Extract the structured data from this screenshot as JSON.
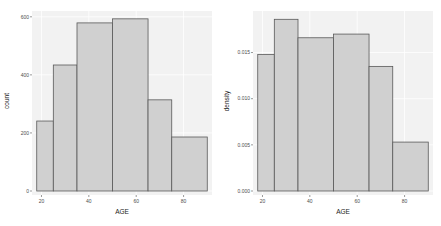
{
  "colors": {
    "panel_bg": "#f2f2f2",
    "grid": "#ffffff",
    "bar_fill": "#d0d0d0",
    "bar_stroke": "#595959",
    "tick_text": "#4d4d4d"
  },
  "chart_data": [
    {
      "type": "bar",
      "subtype": "histogram",
      "title": "",
      "xlabel": "AGE",
      "ylabel": "count",
      "bins": [
        [
          18,
          25
        ],
        [
          25,
          35
        ],
        [
          35,
          50
        ],
        [
          50,
          65
        ],
        [
          65,
          75
        ],
        [
          75,
          90
        ]
      ],
      "values": [
        241,
        434,
        579,
        593,
        314,
        186
      ],
      "xticks": [
        "20",
        "40",
        "60",
        "80"
      ],
      "xtick_values": [
        20,
        40,
        60,
        80
      ],
      "yticks": [
        "0",
        "200",
        "400",
        "600"
      ],
      "ytick_values": [
        0,
        200,
        400,
        600
      ],
      "xlim": [
        16,
        92
      ],
      "ylim": [
        0,
        620
      ],
      "grid": true,
      "legend": null
    },
    {
      "type": "bar",
      "subtype": "histogram",
      "title": "",
      "xlabel": "AGE",
      "ylabel": "density",
      "bins": [
        [
          18,
          25
        ],
        [
          25,
          35
        ],
        [
          35,
          50
        ],
        [
          50,
          65
        ],
        [
          65,
          75
        ],
        [
          75,
          90
        ]
      ],
      "values": [
        0.0148,
        0.0186,
        0.0166,
        0.017,
        0.0135,
        0.0053
      ],
      "xticks": [
        "20",
        "40",
        "60",
        "80"
      ],
      "xtick_values": [
        20,
        40,
        60,
        80
      ],
      "yticks": [
        "0.000",
        "0.005",
        "0.010",
        "0.015"
      ],
      "ytick_values": [
        0,
        0.005,
        0.01,
        0.015
      ],
      "xlim": [
        16,
        92
      ],
      "ylim": [
        0,
        0.0195
      ],
      "grid": true,
      "legend": null
    }
  ]
}
